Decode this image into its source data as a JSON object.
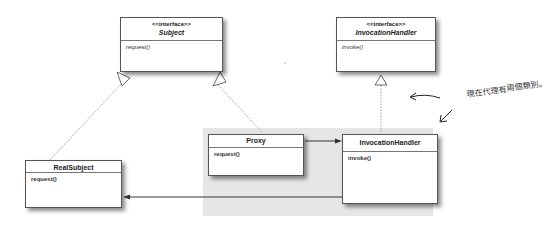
{
  "diagram": {
    "type": "UML class diagram (Dynamic Proxy)",
    "boxes": {
      "subject": {
        "stereotype": "<<interface>>",
        "name": "Subject",
        "method": "request()"
      },
      "invocation_iface": {
        "stereotype": "<<interface>>",
        "name": "InvocationHandler",
        "method": "invoke()"
      },
      "real_subject": {
        "name": "RealSubject",
        "method": "request()"
      },
      "proxy": {
        "name": "Proxy",
        "method": "request()"
      },
      "invocation_handler": {
        "name": "InvocationHandler",
        "method": "invoke()"
      }
    },
    "relationships": [
      {
        "from": "RealSubject",
        "to": "Subject",
        "type": "realization"
      },
      {
        "from": "Proxy",
        "to": "Subject",
        "type": "realization"
      },
      {
        "from": "InvocationHandler",
        "to": "<<interface>> InvocationHandler",
        "type": "realization"
      },
      {
        "from": "Proxy",
        "to": "InvocationHandler",
        "type": "association"
      },
      {
        "from": "InvocationHandler",
        "to": "RealSubject",
        "type": "association"
      }
    ],
    "annotation": "現在代理有兩個類別。",
    "colors": {
      "highlight_region": "#e6e6e6",
      "box_border": "#555555",
      "line": "#444444"
    }
  }
}
